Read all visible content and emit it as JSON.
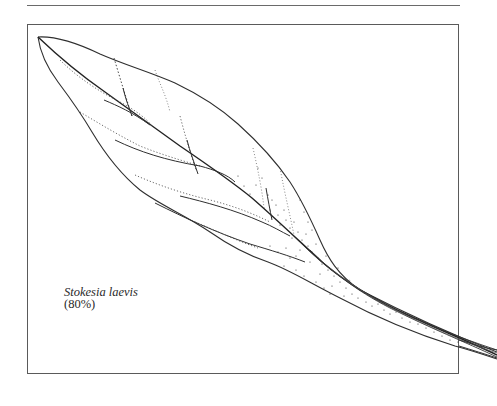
{
  "figure": {
    "caption": {
      "species": "Stokesia laevis",
      "scale": "(80%)"
    },
    "illustration": {
      "subject": "leaf line drawing",
      "style": "ink outline with stippled venation"
    },
    "colors": {
      "ink": "#2a2a2a",
      "frame": "#5a5a5a",
      "background": "#ffffff"
    }
  }
}
